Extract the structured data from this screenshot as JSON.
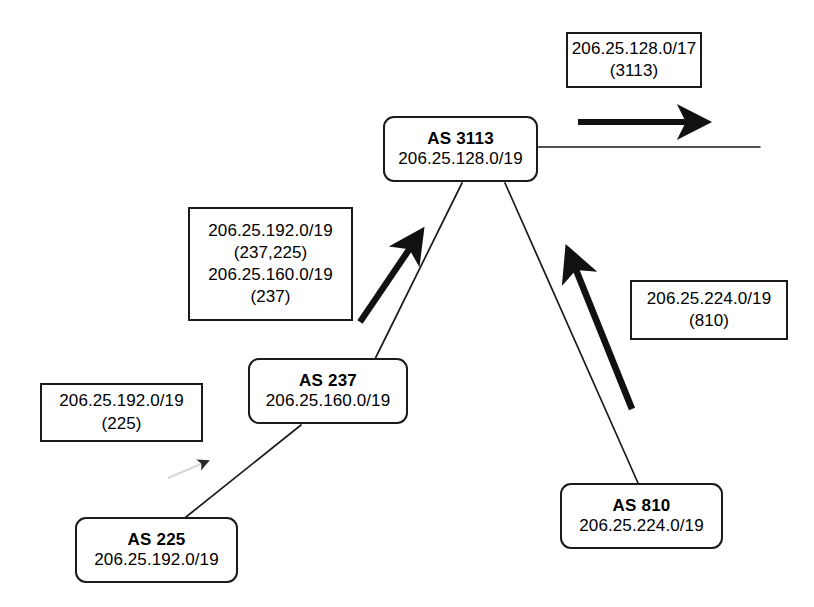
{
  "diagram": {
    "background_color": "#ffffff",
    "line_color": "#1a1a1a",
    "nodes": [
      {
        "id": "as3113",
        "name": "AS 3113",
        "prefix": "206.25.128.0/19",
        "x": 383,
        "y": 116,
        "width": 155,
        "height": 66
      },
      {
        "id": "as237",
        "name": "AS 237",
        "prefix": "206.25.160.0/19",
        "x": 248,
        "y": 358,
        "width": 160,
        "height": 66
      },
      {
        "id": "as225",
        "name": "AS 225",
        "prefix": "206.25.192.0/19",
        "x": 75,
        "y": 517,
        "width": 163,
        "height": 66
      },
      {
        "id": "as810",
        "name": "AS 810",
        "prefix": "206.25.224.0/19",
        "x": 560,
        "y": 483,
        "width": 163,
        "height": 66
      }
    ],
    "advertisements": [
      {
        "id": "adv-3113",
        "lines": [
          "206.25.128.0/17",
          "(3113)"
        ],
        "x": 566,
        "y": 32,
        "width": 136,
        "height": 56
      },
      {
        "id": "adv-237",
        "lines": [
          "206.25.192.0/19",
          "(237,225)",
          "206.25.160.0/19",
          "(237)"
        ],
        "x": 188,
        "y": 207,
        "width": 165,
        "height": 114
      },
      {
        "id": "adv-225",
        "lines": [
          "206.25.192.0/19",
          "(225)"
        ],
        "x": 40,
        "y": 383,
        "width": 163,
        "height": 59
      },
      {
        "id": "adv-810",
        "lines": [
          "206.25.224.0/19",
          "(810)"
        ],
        "x": 630,
        "y": 280,
        "width": 158,
        "height": 60
      }
    ],
    "links": [
      {
        "id": "link-as237-as3113",
        "from": "as237",
        "to": "as3113",
        "x1": 375,
        "y1": 359,
        "x2": 462,
        "y2": 183
      },
      {
        "id": "link-as810-as3113",
        "from": "as810",
        "to": "as3113",
        "x1": 638,
        "y1": 483,
        "x2": 505,
        "y2": 183
      },
      {
        "id": "link-as225-as237",
        "from": "as225",
        "to": "as237",
        "x1": 186,
        "y1": 517,
        "x2": 301,
        "y2": 425
      },
      {
        "id": "link-as3113-upstream",
        "from": "as3113",
        "to": "upstream",
        "x1": 538,
        "y1": 147,
        "x2": 760,
        "y2": 147
      }
    ],
    "announcement_arrows": [
      {
        "id": "arrow-3113-upstream",
        "style": "bold",
        "direction": "right",
        "x1": 578,
        "y1": 122,
        "x2": 710,
        "y2": 122
      },
      {
        "id": "arrow-237-to-3113",
        "style": "bold",
        "direction": "up-right",
        "x1": 360,
        "y1": 322,
        "x2": 425,
        "y2": 226
      },
      {
        "id": "arrow-810-to-3113",
        "style": "bold",
        "direction": "up-left",
        "x1": 632,
        "y1": 409,
        "x2": 562,
        "y2": 242
      },
      {
        "id": "arrow-225-to-237",
        "style": "thin",
        "direction": "up-right",
        "x1": 170,
        "y1": 477,
        "x2": 215,
        "y2": 457
      }
    ]
  }
}
